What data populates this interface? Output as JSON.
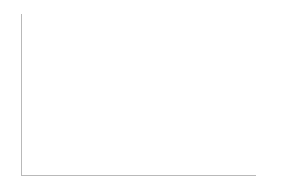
{
  "chart": {
    "yaxis": {
      "labels": [
        "100%",
        "50%",
        "0%"
      ],
      "values": [
        100,
        50,
        0
      ]
    },
    "legend": {
      "position": "right",
      "items": [
        {
          "name": "legend-no-answer",
          "line1": "無回答",
          "line2": ""
        },
        {
          "name": "legend-no-transfer",
          "line1": "これまでに",
          "line2": "異動がない"
        },
        {
          "name": "legend-has-transfer",
          "line1": "これまでに",
          "line2": "異動がある"
        }
      ]
    },
    "highlight": {
      "year": "2020",
      "style": "dashed-box"
    }
  },
  "chart_data": {
    "type": "bar",
    "subtype": "100%-stacked-column",
    "xlabel": "",
    "ylabel": "",
    "ylim": [
      0,
      100
    ],
    "grid": false,
    "legend_position": "right",
    "categories": [
      "2007",
      "2008",
      "2009",
      "2010",
      "2011",
      "2012",
      "2013",
      "2014",
      "2015",
      "2016",
      "2017",
      "2018",
      "2019",
      "2020"
    ],
    "series": [
      {
        "name": "これまでに異動がある",
        "position": "bottom",
        "values": [
          49.7,
          53.0,
          52.4,
          50.3,
          52.1,
          53.6,
          65.5,
          68.2,
          70.7,
          65.8,
          68.5,
          72.2,
          73.2,
          72.9
        ]
      },
      {
        "name": "これまでに異動がない",
        "position": "middle",
        "values": [
          44.4,
          43.1,
          42.6,
          45.4,
          43.2,
          43.7,
          32.9,
          29.4,
          24.9,
          27.9,
          25.9,
          22.7,
          20.1,
          25.2
        ]
      },
      {
        "name": "無回答",
        "position": "top",
        "values": [
          6.0,
          3.9,
          5.0,
          4.3,
          4.8,
          2.7,
          2.4,
          3.5,
          3.6,
          6.3,
          4.3,
          4.1,
          4.0,
          3.9
        ]
      }
    ]
  }
}
